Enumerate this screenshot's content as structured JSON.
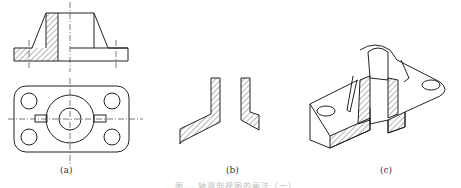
{
  "figure": {
    "subfigures": [
      {
        "label": "(a)",
        "description": "Front section view and top view of flanged base part"
      },
      {
        "label": "(b)",
        "description": "Hatched cut-section profiles"
      },
      {
        "label": "(c)",
        "description": "Isometric cut-away section view"
      }
    ],
    "caption": "图 ·· 轴测剖视图的画法（一）",
    "colors": {
      "line": "#222222",
      "hatch": "#444444",
      "background": "#ffffff"
    }
  }
}
